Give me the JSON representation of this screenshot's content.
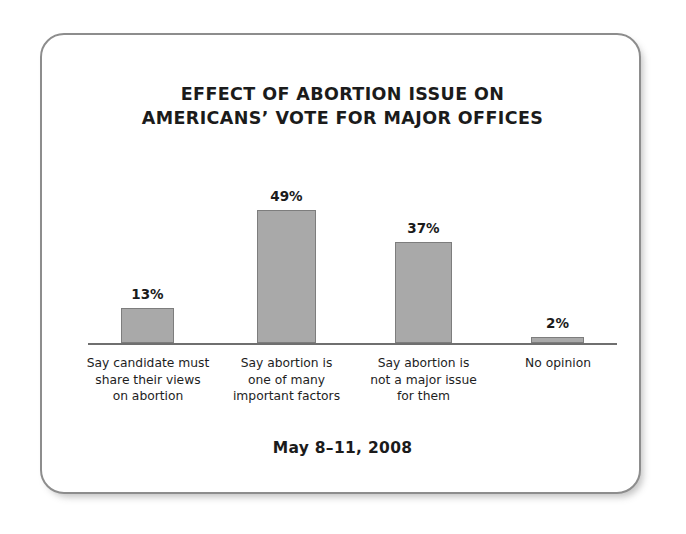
{
  "chart_data": {
    "type": "bar",
    "title_lines": [
      "EFFECT OF ABORTION ISSUE ON",
      "AMERICANS’ VOTE FOR MAJOR OFFICES"
    ],
    "subtitle": "May 8–11, 2008",
    "xlabel": "",
    "ylabel": "",
    "ylim": [
      0,
      55
    ],
    "grid": false,
    "legend": null,
    "categories": [
      "Say candidate must share their views on abortion",
      "Say abortion is one of many important factors",
      "Say abortion is not a major issue for them",
      "No opinion"
    ],
    "category_lines": [
      [
        "Say candidate must",
        "share their views",
        "on abortion"
      ],
      [
        "Say abortion is",
        "one of many",
        "important factors"
      ],
      [
        "Say abortion is",
        "not a major issue",
        "for them"
      ],
      [
        "No opinion"
      ]
    ],
    "values": [
      13,
      49,
      37,
      2
    ],
    "value_labels": [
      "13%",
      "49%",
      "37%",
      "2%"
    ],
    "bar_color": "#a9a9a9",
    "bar_border_color": "#7d7d7d",
    "axis_color": "#6f6f6f",
    "text_color": "#1b1b1b"
  },
  "frame": {
    "border_color": "#8d8d8d",
    "background": "#ffffff"
  }
}
